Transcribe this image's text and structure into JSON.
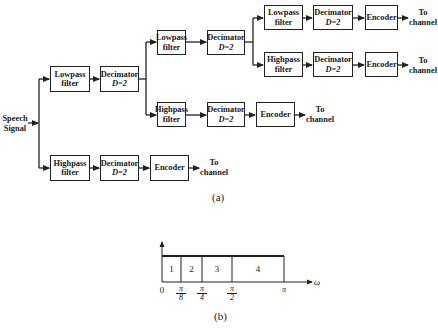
{
  "figure_a": {
    "caption": "(a)",
    "input_label": [
      "Speech",
      "Signal"
    ],
    "output_label": [
      "To",
      "channel"
    ],
    "blocks": {
      "lowpass": [
        "Lowpass",
        "filter"
      ],
      "highpass": [
        "Highpass",
        "filter"
      ],
      "decimator": [
        "Decimator",
        "D=2"
      ],
      "encoder": "Encoder"
    },
    "stages": [
      {
        "level": 1,
        "branch": "lowpass",
        "path": [
          "Lowpass filter",
          "Decimator D=2"
        ]
      },
      {
        "level": 1,
        "branch": "highpass",
        "path": [
          "Highpass filter",
          "Decimator D=2",
          "Encoder",
          "To channel"
        ]
      },
      {
        "level": 2,
        "branch": "lowpass",
        "path": [
          "Lowpass filter",
          "Decimator D=2"
        ]
      },
      {
        "level": 2,
        "branch": "highpass",
        "path": [
          "Highpass filter",
          "Decimator D=2",
          "Encoder",
          "To channel"
        ]
      },
      {
        "level": 3,
        "branch": "lowpass",
        "path": [
          "Lowpass filter",
          "Decimator D=2",
          "Encoder",
          "To channel"
        ]
      },
      {
        "level": 3,
        "branch": "highpass",
        "path": [
          "Highpass filter",
          "Decimator D=2",
          "Encoder",
          "To channel"
        ]
      }
    ]
  },
  "figure_b": {
    "caption": "(b)",
    "axis_label": "ω",
    "origin_label": "0",
    "ticks": [
      {
        "num": "π",
        "den": "8"
      },
      {
        "num": "π",
        "den": "4"
      },
      {
        "num": "π",
        "den": "2"
      },
      {
        "num": "π",
        "den": ""
      }
    ],
    "bands": [
      "1",
      "2",
      "3",
      "4"
    ]
  }
}
